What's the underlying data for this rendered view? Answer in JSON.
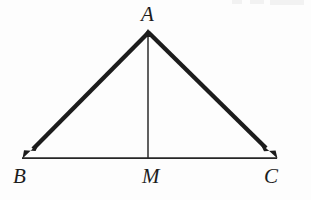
{
  "figure": {
    "background_color": "#fdfdfd",
    "stroke_color": "#1c1c1c",
    "thin_stroke_color": "#262626",
    "labels": {
      "apex": "A",
      "bottom_left": "B",
      "midpoint": "M",
      "bottom_right": "C"
    },
    "points": {
      "A": {
        "x": 148,
        "y": 31
      },
      "B": {
        "x": 22,
        "y": 158
      },
      "M": {
        "x": 148,
        "y": 158
      },
      "C": {
        "x": 277,
        "y": 158
      }
    },
    "segments": [
      {
        "name": "vector-AB",
        "from": "A",
        "to": "B",
        "arrow": true,
        "width": 4.2
      },
      {
        "name": "vector-AC",
        "from": "A",
        "to": "C",
        "arrow": true,
        "width": 4.2
      },
      {
        "name": "base-BC",
        "from": "B",
        "to": "C",
        "arrow": false,
        "width": 1.6
      },
      {
        "name": "median-AM",
        "from": "A",
        "to": "M",
        "arrow": false,
        "width": 1.5
      }
    ]
  }
}
